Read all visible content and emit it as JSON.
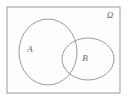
{
  "figure": {
    "kind": "venn-diagram",
    "background_color": "#ffffff",
    "stroke_color": "#8e8e8e",
    "label_color": "#6b6b6b",
    "width": 128,
    "height": 102
  },
  "universe": {
    "label": "Ω",
    "label_x": 110,
    "label_y": 18,
    "rect": {
      "x": 7,
      "y": 7,
      "width": 113,
      "height": 86
    },
    "fill": "#fefefe",
    "stroke": "#9a9a9a"
  },
  "sets": [
    {
      "name": "set-a",
      "label": "A",
      "shape": "circle",
      "cx": 48,
      "cy": 52,
      "rx": 29,
      "ry": 33,
      "label_x": 30,
      "label_y": 52
    },
    {
      "name": "set-b",
      "label": "B",
      "shape": "ellipse",
      "cx": 88,
      "cy": 59,
      "rx": 26,
      "ry": 21,
      "label_x": 85,
      "label_y": 61
    }
  ]
}
